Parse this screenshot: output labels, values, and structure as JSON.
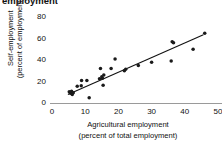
{
  "figure": {
    "heading_clipped": "employment",
    "background_color": "#ffffff",
    "marker_color": "#1a1a1a",
    "line_color": "#111111",
    "baseline_color": "#9a9a9a"
  },
  "chart_data": {
    "type": "scatter",
    "title": "employment",
    "xlabel": "Agricultural employment",
    "xlabel_line2": "(percent of total employment)",
    "ylabel": "Self-employment",
    "ylabel_line2": "(percent of employment)",
    "xlim": [
      0,
      50
    ],
    "ylim": [
      0,
      80
    ],
    "xticks": [
      0,
      10,
      20,
      30,
      40,
      50
    ],
    "yticks": [
      0,
      20,
      40,
      60,
      80
    ],
    "xtick_labels": [
      "0",
      "10",
      "20",
      "30",
      "40",
      "50"
    ],
    "ytick_labels": [
      "0",
      "20",
      "40",
      "60",
      "80"
    ],
    "grid": false,
    "legend": false,
    "points": [
      {
        "x": 5.2,
        "y": 10.5
      },
      {
        "x": 5.6,
        "y": 9.0
      },
      {
        "x": 5.9,
        "y": 11.0
      },
      {
        "x": 6.1,
        "y": 8.0
      },
      {
        "x": 6.4,
        "y": 9.5
      },
      {
        "x": 7.6,
        "y": 15.5
      },
      {
        "x": 8.8,
        "y": 16.0
      },
      {
        "x": 8.9,
        "y": 21.0
      },
      {
        "x": 10.5,
        "y": 21.0
      },
      {
        "x": 11.2,
        "y": 5.0
      },
      {
        "x": 14.3,
        "y": 22.5
      },
      {
        "x": 14.6,
        "y": 32.0
      },
      {
        "x": 15.0,
        "y": 24.5
      },
      {
        "x": 15.2,
        "y": 23.0
      },
      {
        "x": 15.4,
        "y": 16.5
      },
      {
        "x": 15.6,
        "y": 26.0
      },
      {
        "x": 17.8,
        "y": 32.0
      },
      {
        "x": 19.0,
        "y": 41.0
      },
      {
        "x": 21.8,
        "y": 30.0
      },
      {
        "x": 22.2,
        "y": 31.5
      },
      {
        "x": 26.0,
        "y": 35.0
      },
      {
        "x": 30.0,
        "y": 38.0
      },
      {
        "x": 35.9,
        "y": 39.0
      },
      {
        "x": 36.2,
        "y": 57.0
      },
      {
        "x": 36.6,
        "y": 56.0
      },
      {
        "x": 42.5,
        "y": 50.0
      },
      {
        "x": 46.0,
        "y": 65.0
      }
    ],
    "fit_line": {
      "type": "linear",
      "x_start": 4.8,
      "y_start": 8.0,
      "x_end": 45.6,
      "y_end": 63.5
    }
  }
}
